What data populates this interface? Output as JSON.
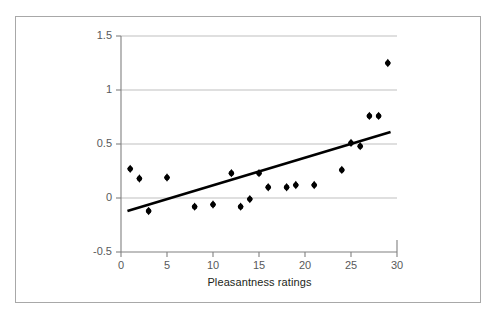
{
  "chart_data": {
    "type": "scatter",
    "title": "",
    "subtitle": "",
    "xlabel": "Pleasantness ratings",
    "ylabel": "",
    "xlim": [
      0,
      30
    ],
    "ylim": [
      -0.5,
      1.5
    ],
    "xticks": [
      0,
      5,
      10,
      15,
      20,
      25,
      30
    ],
    "xtick_labels": [
      "0",
      "5",
      "10",
      "15",
      "20",
      "25",
      "30"
    ],
    "yticks": [
      -0.5,
      0,
      0.5,
      1,
      1.5
    ],
    "ytick_labels": [
      "-0.5",
      "0",
      "0.5",
      "1",
      "1.5"
    ],
    "grid": "horizontal",
    "legend": "none",
    "marker": "diamond",
    "marker_color": "#000000",
    "series": [
      {
        "name": "observations",
        "x": [
          1,
          2,
          3,
          5,
          8,
          10,
          12,
          13,
          14,
          15,
          16,
          18,
          19,
          21,
          24,
          25,
          26,
          27,
          28,
          29
        ],
        "y": [
          0.27,
          0.18,
          -0.12,
          0.19,
          -0.08,
          -0.06,
          0.23,
          -0.08,
          -0.01,
          0.23,
          0.1,
          0.1,
          0.12,
          0.12,
          0.26,
          0.51,
          0.48,
          0.76,
          0.76,
          1.25
        ]
      }
    ],
    "trendline": {
      "name": "linear fit",
      "x_start": 0.7,
      "y_start": -0.12,
      "x_end": 29.3,
      "y_end": 0.61,
      "color": "#000000",
      "width": 2.6
    }
  },
  "axes": {
    "x_label_text": "Pleasantness ratings",
    "x_tick_values": [
      "0",
      "5",
      "10",
      "15",
      "20",
      "25",
      "30"
    ],
    "y_tick_values": [
      "1.5",
      "1",
      "0.5",
      "0",
      "-0.5"
    ]
  },
  "colors": {
    "frame": "#a8a8a8",
    "axis": "#808080",
    "gridline": "#bfbfbf",
    "marker": "#000000",
    "trendline": "#000000",
    "tick_text": "#58595b",
    "label_text": "#231f20",
    "background": "#ffffff"
  }
}
